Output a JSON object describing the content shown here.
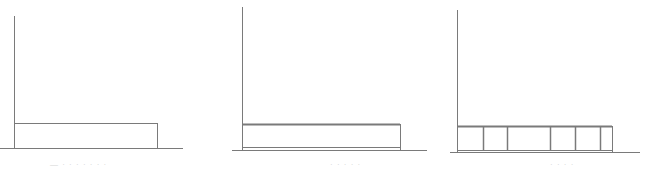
{
  "diagram": {
    "line_color": "#7a7a7a",
    "panels": [
      {
        "id": "panel-1",
        "axis_x": 14,
        "axis_top": 16,
        "baseline_y": 148,
        "baseline_x1": 0,
        "baseline_x2": 183,
        "rect": {
          "x1": 14,
          "x2": 157,
          "top": 123
        },
        "inner_line": false,
        "dividers": [],
        "caption": "— · · · · · · ·"
      },
      {
        "id": "panel-2",
        "axis_x": 242,
        "axis_top": 7,
        "baseline_y": 150,
        "baseline_x1": 232,
        "baseline_x2": 427,
        "rect": {
          "x1": 242,
          "x2": 400,
          "top": 124
        },
        "inner_line": true,
        "inner_line_y": 147,
        "dividers": [],
        "caption": "· · · · ·"
      },
      {
        "id": "panel-3",
        "axis_x": 457,
        "axis_top": 10,
        "baseline_y": 152,
        "baseline_x1": 450,
        "baseline_x2": 640,
        "rect": {
          "x1": 457,
          "x2": 612,
          "top": 126
        },
        "inner_line": true,
        "inner_line_y": 150,
        "dividers": [
          483,
          507,
          550,
          575,
          600
        ],
        "caption": "· · · ·"
      }
    ]
  }
}
